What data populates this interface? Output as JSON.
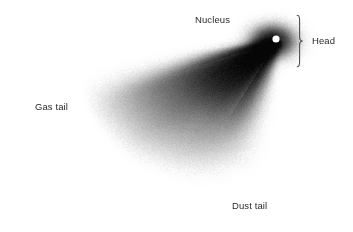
{
  "figure": {
    "background_color": "#ffffff",
    "ink_color": "#000000",
    "text_color": "#2b2b2b",
    "width": 353,
    "height": 232
  },
  "labels": {
    "nucleus": "Nucleus",
    "gas_tail": "Gas tail",
    "dust_tail": "Dust tail",
    "head": "Head"
  },
  "diagram": {
    "nucleus_point": {
      "x": 276,
      "y": 39,
      "radius": 3.6,
      "color": "#ffffff"
    },
    "coma": {
      "cx": 272,
      "cy": 41,
      "rx": 26,
      "ry": 19,
      "peak_opacity": 0.95
    },
    "head_bracket": {
      "x": 296,
      "y_top": 17,
      "y_bottom": 65,
      "nib_x": 305,
      "nib_y": 41
    },
    "tail_origin": {
      "x": 277,
      "y": 40
    },
    "tail_rays": [
      {
        "name": "gas-tail-upper-edge",
        "angle_deg": 199,
        "length": 205,
        "width": 20,
        "opacity": 0.55
      },
      {
        "name": "gas-tail-bright-streamer",
        "angle_deg": 203,
        "length": 200,
        "width": 26,
        "opacity": 0.72
      },
      {
        "name": "gas-tail-core",
        "angle_deg": 209,
        "length": 196,
        "width": 30,
        "opacity": 0.88
      },
      {
        "name": "mid-streamer-a",
        "angle_deg": 216,
        "length": 188,
        "width": 27,
        "opacity": 0.82
      },
      {
        "name": "mid-streamer-b",
        "angle_deg": 224,
        "length": 178,
        "width": 26,
        "opacity": 0.76
      },
      {
        "name": "dust-streamer-a",
        "angle_deg": 232,
        "length": 168,
        "width": 24,
        "opacity": 0.7
      },
      {
        "name": "dust-streamer-b",
        "angle_deg": 240,
        "length": 156,
        "width": 23,
        "opacity": 0.62
      },
      {
        "name": "dust-tail-lower-edge",
        "angle_deg": 248,
        "length": 140,
        "width": 22,
        "opacity": 0.5
      }
    ],
    "dark_wedge": {
      "name": "inner-dark-coma-wedge",
      "angle_start_deg": 198,
      "angle_end_deg": 238,
      "length": 110,
      "opacity": 0.97
    }
  }
}
